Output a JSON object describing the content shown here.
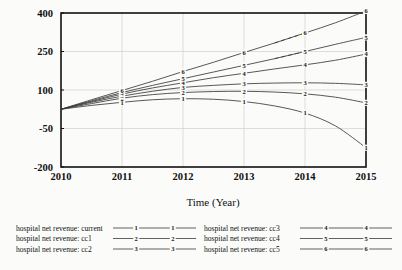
{
  "chart_data": {
    "type": "line",
    "title": "",
    "xlabel": "Time (Year)",
    "ylabel": "",
    "x": [
      2010,
      2010.5,
      2011,
      2011.5,
      2012,
      2012.5,
      2013,
      2013.5,
      2014,
      2014.5,
      2015
    ],
    "xlim": [
      2010,
      2015
    ],
    "ylim": [
      -200,
      400
    ],
    "xticks": [
      "2010",
      "2011",
      "2012",
      "2013",
      "2014",
      "2015"
    ],
    "yticks": [
      "400",
      "250",
      "100",
      "-50",
      "-200"
    ],
    "grid": true,
    "legend_position": "below",
    "series": [
      {
        "name": "hospital net revenue: current",
        "marker": "1",
        "style": "solid",
        "values": [
          25,
          40,
          52,
          62,
          66,
          64,
          55,
          38,
          10,
          -40,
          -125
        ]
      },
      {
        "name": "hospital net revenue: cc1",
        "marker": "2",
        "style": "solid",
        "values": [
          25,
          47,
          68,
          82,
          90,
          94,
          95,
          92,
          85,
          72,
          50
        ]
      },
      {
        "name": "hospital net revenue: cc2",
        "marker": "3",
        "style": "solid",
        "values": [
          25,
          52,
          76,
          95,
          110,
          118,
          124,
          127,
          128,
          126,
          120
        ]
      },
      {
        "name": "hospital net revenue: cc3",
        "marker": "4",
        "style": "solid",
        "values": [
          25,
          55,
          84,
          108,
          128,
          148,
          165,
          182,
          198,
          216,
          240
        ]
      },
      {
        "name": "hospital net revenue: cc4",
        "marker": "5",
        "style": "dashed-end",
        "values": [
          25,
          58,
          90,
          118,
          144,
          170,
          196,
          222,
          250,
          278,
          305
        ]
      },
      {
        "name": "hospital net revenue: cc5",
        "marker": "6",
        "style": "dashed-end",
        "values": [
          25,
          62,
          98,
          134,
          172,
          208,
          246,
          283,
          322,
          362,
          408
        ]
      }
    ]
  },
  "legend": {
    "column_left": [
      {
        "label": "hospital net revenue: current",
        "marker": "1"
      },
      {
        "label": "hospital net revenue: cc1",
        "marker": "2"
      },
      {
        "label": "hospital net revenue: cc2",
        "marker": "3"
      }
    ],
    "column_right": [
      {
        "label": "hospital net revenue: cc3",
        "marker": "4"
      },
      {
        "label": "hospital net revenue: cc4",
        "marker": "5"
      },
      {
        "label": "hospital net revenue: cc5",
        "marker": "6"
      }
    ]
  },
  "colors": {
    "line": "#3a3a3a",
    "axis": "#111111",
    "grid": "#c9c9c9",
    "background": "#fbfbf9"
  }
}
